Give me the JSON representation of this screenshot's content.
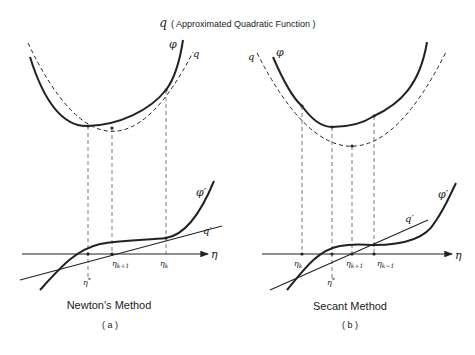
{
  "title": {
    "symbol": "q",
    "text": "( Approximated  Quadratic  Function )"
  },
  "panels": [
    {
      "id": "a",
      "caption": "Newton's Method",
      "sublabel": "( a )",
      "curve_labels": {
        "phi": "φ",
        "q": "q",
        "phi_prime": "φ′",
        "q_prime": "q′"
      },
      "axis_label": "η",
      "point_labels": {
        "eta_k": "ηk",
        "eta_k1": "ηk+1",
        "eta_star": "η*"
      }
    },
    {
      "id": "b",
      "caption": "Secant Method",
      "sublabel": "( b )",
      "curve_labels": {
        "phi": "φ",
        "q": "q",
        "phi_prime": "φ′",
        "q_prime": "q′"
      },
      "axis_label": "η",
      "point_labels": {
        "eta_k": "ηk",
        "eta_k1": "ηk+1",
        "eta_km1": "ηk−1",
        "eta_star": "η*"
      }
    }
  ],
  "colors": {
    "ink": "#222222",
    "background": "#ffffff"
  }
}
